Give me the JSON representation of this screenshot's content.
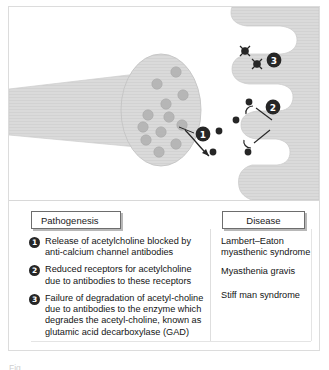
{
  "figure": {
    "name": "neuromuscular-junction-pathogenesis-figure",
    "caption_clipped": "Fig."
  },
  "colors": {
    "neuron_fill": "#d9d9d9",
    "neuron_stroke": "#c4c4c4",
    "vesicle_fill": "#b4b4b4",
    "vesicle_stroke": "#a6a6a6",
    "molecule_fill": "#262626",
    "badge_fill": "#262626",
    "badge_text": "#ffffff",
    "frame_border": "#dcdcdc",
    "chip_border": "#6d6d6d",
    "chip_shadow": "#b8b8b8",
    "text": "#141414"
  },
  "diagram": {
    "label": "Neuromuscular junction synapse diagram",
    "presynaptic_terminal": "presynaptic-nerve-terminal",
    "axon": "axon-shaft",
    "synaptic_cleft": "synaptic-cleft",
    "postsynaptic_membrane": "postsynaptic-membrane-folds",
    "markers": [
      {
        "id": "1",
        "label": "1"
      },
      {
        "id": "2",
        "label": "2"
      },
      {
        "id": "3",
        "label": "3"
      }
    ],
    "vesicle_count": 12,
    "free_molecule_count": 3,
    "receptor_count": 2,
    "degraded_molecule_count": 2
  },
  "table": {
    "headers": {
      "pathogenesis": "Pathogenesis",
      "disease": "Disease"
    },
    "pathogenesis_items": [
      {
        "number": "1",
        "text": "Release of acetylcholine blocked by anti-calcium channel antibodies"
      },
      {
        "number": "2",
        "text": "Reduced receptors for acetylcholine due to antibodies to these receptors"
      },
      {
        "number": "3",
        "text": "Failure of degradation of acetyl-choline due to antibodies to the enzyme which degrades the acetyl-choline, known as glutamic acid decarboxylase (GAD)"
      }
    ],
    "disease_items": [
      "Lambert–Eaton myasthenic syndrome",
      "Myasthenia gravis",
      "Stiff man syndrome"
    ]
  }
}
